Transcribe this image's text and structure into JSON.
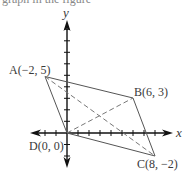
{
  "diagram": {
    "type": "coordinate-plane-quadrilateral",
    "top_cutoff_text": "graph in the figure",
    "axes": {
      "x_label": "x",
      "y_label": "y",
      "x_ticks": [
        -5,
        -4,
        -3,
        -2,
        -1,
        1,
        2,
        3,
        4,
        5,
        6,
        7,
        8,
        9
      ],
      "y_ticks": [
        -3,
        -2,
        -1,
        1,
        2,
        3,
        4,
        5,
        6,
        7,
        8,
        9
      ]
    },
    "points": [
      {
        "name": "A",
        "label": "A(−2, 5)",
        "x": -2,
        "y": 5
      },
      {
        "name": "B",
        "label": "B(6, 3)",
        "x": 6,
        "y": 3
      },
      {
        "name": "C",
        "label": "C(8, −2)",
        "x": 8,
        "y": -2
      },
      {
        "name": "D",
        "label": "D(0, 0)",
        "x": 0,
        "y": 0
      }
    ],
    "sides": [
      "AB",
      "BC",
      "CD",
      "DA"
    ],
    "diagonals": [
      "AC",
      "BD"
    ],
    "colors": {
      "axis": "#111111",
      "sides": "#555555",
      "diagonals": "#777777",
      "text": "#3a3a3a"
    }
  }
}
